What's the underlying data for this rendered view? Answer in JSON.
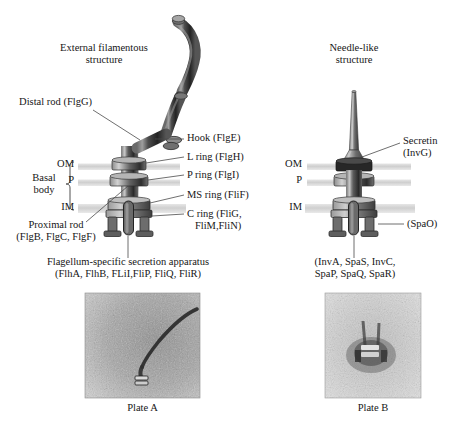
{
  "figure": {
    "left_panel": {
      "title_top": "External filamentous\nstructure",
      "labels": {
        "distal_rod": "Distal rod (FlgG)",
        "hook": "Hook (FlgE)",
        "l_ring": "L ring (FlgH)",
        "p_ring": "P ring (FlgI)",
        "ms_ring": "MS ring (FliF)",
        "c_ring": "C ring (FliG,\n   FliM,FliN)",
        "basal_body": "Basal\nbody",
        "om": "OM",
        "p": "P",
        "im": "IM",
        "proximal_rod": "Proximal rod\n(FlgB, FlgC, FlgF)",
        "secretion_apparatus": "Flagellum-specific secretion apparatus\n(FlhA, FlhB, FLiI,FliP, FliQ, FliR)"
      }
    },
    "right_panel": {
      "title_top": "Needle-like\nstructure",
      "labels": {
        "secretin": "Secretin\n(InvG)",
        "om": "OM",
        "p": "P",
        "im": "IM",
        "spao": "(SpaO)",
        "secretion_apparatus": "(InvA, SpaS, InvC,\nSpaP, SpaQ, SpaR)"
      }
    },
    "micrographs": [
      {
        "name": "plate-a",
        "caption": "Plate A"
      },
      {
        "name": "plate-b",
        "caption": "Plate B"
      }
    ],
    "colors": {
      "ink": "#161616",
      "leader": "#4a4a4a",
      "membrane": "#d3d3d3",
      "structure_dark": "#2b2b2b",
      "structure_mid": "#6f6f6f",
      "structure_light": "#c9c9c9"
    }
  }
}
